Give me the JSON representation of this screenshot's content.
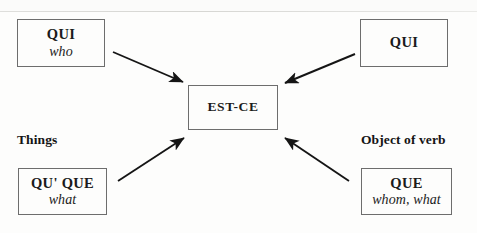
{
  "diagram": {
    "type": "converging-arrow-diagram",
    "center": {
      "id": "est-ce",
      "term": "EST-CE",
      "gloss": "",
      "box": {
        "x": 188,
        "y": 85,
        "w": 90,
        "h": 45
      }
    },
    "nodes": [
      {
        "id": "qui-subject",
        "term": "QUI",
        "gloss": "who",
        "position": "top-left",
        "box": {
          "x": 17,
          "y": 19,
          "w": 88,
          "h": 48
        }
      },
      {
        "id": "qui-object",
        "term": "QUI",
        "gloss": "",
        "position": "top-right",
        "box": {
          "x": 360,
          "y": 19,
          "w": 88,
          "h": 48
        }
      },
      {
        "id": "qu-que-subject",
        "term": "QU' QUE",
        "gloss": "what",
        "position": "bottom-left",
        "box": {
          "x": 18,
          "y": 168,
          "w": 89,
          "h": 47
        }
      },
      {
        "id": "que-object",
        "term": "QUE",
        "gloss": "whom, what",
        "position": "bottom-right",
        "box": {
          "x": 361,
          "y": 168,
          "w": 91,
          "h": 47
        }
      }
    ],
    "labels": [
      {
        "id": "things",
        "text": "Things",
        "position": "middle-left",
        "x": 17,
        "y": 132
      },
      {
        "id": "object-of-verb",
        "text": "Object of verb",
        "position": "middle-right",
        "x": 361,
        "y": 132
      }
    ],
    "arrows": [
      {
        "id": "arrow-top-left",
        "from": "qui-subject",
        "to": "est-ce",
        "x1": 113,
        "y1": 52,
        "x2": 185,
        "y2": 83
      },
      {
        "id": "arrow-top-right",
        "from": "qui-object",
        "to": "est-ce",
        "x1": 355,
        "y1": 54,
        "x2": 283,
        "y2": 84
      },
      {
        "id": "arrow-bottom-left",
        "from": "qu-que-subject",
        "to": "est-ce",
        "x1": 118,
        "y1": 181,
        "x2": 186,
        "y2": 136
      },
      {
        "id": "arrow-bottom-right",
        "from": "que-object",
        "to": "est-ce",
        "x1": 349,
        "y1": 181,
        "x2": 283,
        "y2": 136
      }
    ],
    "colors": {
      "box_border": "#6d6d6d",
      "arrow": "#151515",
      "text": "#1b1b1b",
      "background": "#fdfdfc"
    }
  }
}
